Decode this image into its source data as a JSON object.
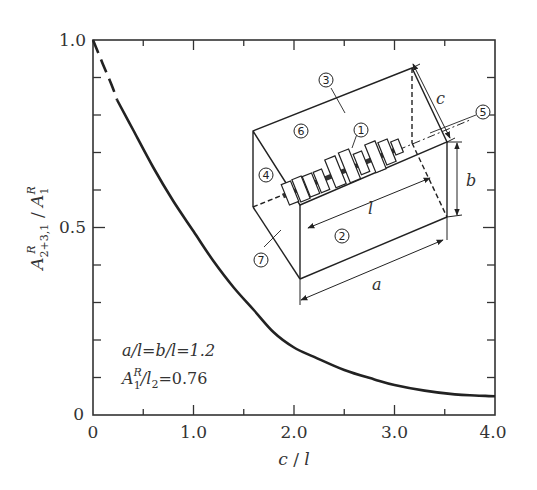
{
  "chart_data": {
    "type": "line",
    "title": "",
    "xlabel": "c / l",
    "ylabel": "A^R_{2+3,1} / A^R_1",
    "xlim": [
      0,
      4.0
    ],
    "ylim": [
      0,
      1.0
    ],
    "x_ticks_major": [
      0,
      1.0,
      2.0,
      3.0,
      4.0
    ],
    "x_tick_labels": [
      "0",
      "1.0",
      "2.0",
      "3.0",
      "4.0"
    ],
    "x_ticks_minor": [
      0.5,
      1.5,
      2.5,
      3.5
    ],
    "y_ticks_major": [
      0,
      0.5,
      1.0
    ],
    "y_tick_labels": [
      "0",
      "0.5",
      "1.0"
    ],
    "y_ticks_minor": [
      0.1,
      0.2,
      0.3,
      0.4,
      0.6,
      0.7,
      0.8,
      0.9
    ],
    "grid": false,
    "series": [
      {
        "name": "dashed (extrapolated)",
        "style": "dashed",
        "x": [
          0.0,
          0.1,
          0.2,
          0.24
        ],
        "y": [
          1.0,
          0.935,
          0.87,
          0.84
        ]
      },
      {
        "name": "solid",
        "style": "solid",
        "x": [
          0.24,
          0.4,
          0.6,
          0.8,
          1.0,
          1.2,
          1.4,
          1.6,
          1.8,
          2.0,
          2.2,
          2.5,
          2.8,
          3.0,
          3.3,
          3.6,
          3.8,
          4.0
        ],
        "y": [
          0.84,
          0.76,
          0.66,
          0.57,
          0.49,
          0.41,
          0.34,
          0.28,
          0.22,
          0.18,
          0.155,
          0.12,
          0.095,
          0.08,
          0.065,
          0.055,
          0.052,
          0.05
        ]
      }
    ],
    "annotations": [
      "a/l = b/l = 1.2",
      "A^R_1 / l_2 = 0.76"
    ]
  },
  "axes": {
    "x_label_main": "c",
    "x_label_sep": " / ",
    "x_label_den": "l",
    "y_label_A": "A",
    "y_label_sub": "2+3,1",
    "y_label_sup": "R",
    "y_label_sep": " / ",
    "y_label_A2": "A",
    "y_label_sub2": "1",
    "y_label_sup2": "R"
  },
  "ticks": {
    "x": [
      "0",
      "1.0",
      "2.0",
      "3.0",
      "4.0"
    ],
    "y": [
      "0",
      "0.5",
      "1.0"
    ]
  },
  "annotation": {
    "line1": "a/l=b/l=1.2",
    "line2_A": "A",
    "line2_sup": "R",
    "line2_sub": "1",
    "line2_rest": "/l",
    "line2_sub2": "2",
    "line2_val": "=0.76"
  },
  "inset": {
    "labels": {
      "c1": "1",
      "c2": "2",
      "c3": "3",
      "c4": "4",
      "c5": "5",
      "c6": "6",
      "c7": "7"
    },
    "dims": {
      "a": "a",
      "b": "b",
      "c": "c",
      "l": "l"
    }
  }
}
